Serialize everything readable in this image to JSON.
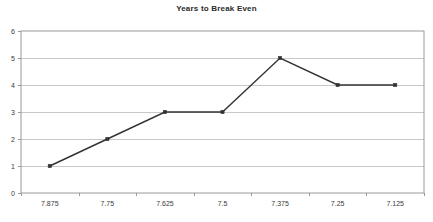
{
  "chart_data": {
    "type": "line",
    "title": "Years to Break Even",
    "xlabel": "",
    "ylabel": "",
    "categories": [
      "7.875",
      "7.75",
      "7.625",
      "7.5",
      "7.375",
      "7.25",
      "7.125"
    ],
    "values": [
      1,
      2,
      3,
      3,
      5,
      4,
      4
    ],
    "series": [
      {
        "name": "Years to Break Even",
        "values": [
          1,
          2,
          3,
          3,
          5,
          4,
          4
        ]
      }
    ],
    "ylim": [
      0,
      6
    ],
    "y_ticks": [
      "0",
      "1",
      "2",
      "3",
      "4",
      "5",
      "6"
    ],
    "grid": true,
    "legend": false,
    "legend_position": "none",
    "line_color": "#333333",
    "marker": "square",
    "marker_color": "#333333",
    "gridline_color": "#c8c8c8",
    "frame_color": "#9a9a9a",
    "background_color": "#ffffff",
    "title_color": "#2b2b2b",
    "tick_label_color": "#3a3a3a"
  }
}
